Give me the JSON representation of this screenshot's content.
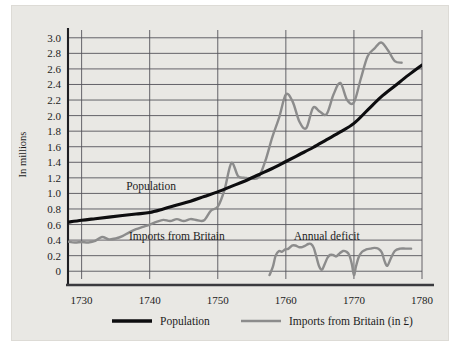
{
  "chart_data": {
    "type": "line",
    "title": "",
    "subtitle": "",
    "xlabel": "",
    "ylabel": "In millions",
    "xlim": [
      1728,
      1780
    ],
    "ylim": [
      -0.1,
      3.1
    ],
    "grid": true,
    "legend_position": "bottom",
    "x_ticks": [
      "1730",
      "1740",
      "1750",
      "1760",
      "1770",
      "1780"
    ],
    "x_tick_values": [
      1730,
      1740,
      1750,
      1760,
      1770,
      1780
    ],
    "y_ticks": [
      "0",
      "0.2",
      "0.4",
      "0.6",
      "0.8",
      "1.0",
      "1.2",
      "1.4",
      "1.6",
      "1.8",
      "2.0",
      "2.2",
      "2.4",
      "2.6",
      "2.8",
      "3.0"
    ],
    "y_tick_values": [
      0,
      0.2,
      0.4,
      0.6,
      0.8,
      1.0,
      1.2,
      1.4,
      1.6,
      1.8,
      2.0,
      2.2,
      2.4,
      2.6,
      2.8,
      3.0
    ],
    "annotations": [
      {
        "text": "Population",
        "x": 1740.2,
        "y": 1.04
      },
      {
        "text": "Imports from Britain",
        "x": 1744.0,
        "y": 0.4
      },
      {
        "text": "Annual deficit",
        "x": 1766.0,
        "y": 0.4
      }
    ],
    "series": [
      {
        "name": "Population",
        "color": "#0d0d0f",
        "x": [
          1728,
          1730,
          1732,
          1734,
          1736,
          1738,
          1740,
          1742,
          1744,
          1746,
          1748,
          1750,
          1752,
          1754,
          1756,
          1758,
          1760,
          1762,
          1764,
          1766,
          1768,
          1770,
          1772,
          1774,
          1776,
          1778,
          1780
        ],
        "y": [
          0.63,
          0.655,
          0.675,
          0.695,
          0.715,
          0.735,
          0.755,
          0.8,
          0.85,
          0.9,
          0.96,
          1.02,
          1.09,
          1.16,
          1.24,
          1.32,
          1.41,
          1.5,
          1.59,
          1.69,
          1.79,
          1.9,
          2.07,
          2.24,
          2.38,
          2.52,
          2.65
        ]
      },
      {
        "name": "Imports from Britain (in £)",
        "color": "#8c8c8c",
        "x": [
          1728,
          1729,
          1730,
          1731,
          1732,
          1733,
          1734,
          1735,
          1736,
          1737,
          1738,
          1739,
          1740,
          1741,
          1742,
          1743,
          1744,
          1745,
          1746,
          1747,
          1748,
          1749,
          1750,
          1751,
          1752,
          1753,
          1754,
          1755,
          1756,
          1757,
          1758,
          1759,
          1760,
          1761,
          1762,
          1763,
          1764,
          1765,
          1766,
          1767,
          1768,
          1769,
          1770,
          1771,
          1772,
          1773,
          1774,
          1775,
          1776,
          1777
        ],
        "y": [
          0.38,
          0.37,
          0.375,
          0.37,
          0.39,
          0.44,
          0.41,
          0.42,
          0.45,
          0.5,
          0.54,
          0.57,
          0.6,
          0.635,
          0.66,
          0.645,
          0.67,
          0.645,
          0.67,
          0.655,
          0.655,
          0.78,
          0.83,
          1.05,
          1.39,
          1.22,
          1.2,
          1.19,
          1.21,
          1.42,
          1.72,
          1.97,
          2.27,
          2.18,
          1.92,
          1.84,
          2.1,
          2.05,
          2.02,
          2.27,
          2.42,
          2.2,
          2.17,
          2.47,
          2.76,
          2.86,
          2.94,
          2.84,
          2.7,
          2.68
        ]
      },
      {
        "name": "Annual deficit",
        "color": "#8c8c8c",
        "x": [
          1757.6,
          1758,
          1758.6,
          1759,
          1759.5,
          1760,
          1760.6,
          1761,
          1761.5,
          1762,
          1762.6,
          1763,
          1763.5,
          1764,
          1764.5,
          1765,
          1765.4,
          1765.8,
          1766.2,
          1766.6,
          1767,
          1767.5,
          1768,
          1768.5,
          1769,
          1769.4,
          1769.8,
          1770,
          1770.3,
          1770.8,
          1771.3,
          1772,
          1772.6,
          1773,
          1773.5,
          1774,
          1774.4,
          1774.8,
          1775.3,
          1776,
          1776.6,
          1777.3,
          1778
        ]
      }
    ],
    "legend": [
      {
        "label": "Population",
        "color": "#0d0d0f",
        "style": "thick-black-line"
      },
      {
        "label": "Imports from Britain (in £)",
        "color": "#8c8c8c",
        "style": "thick-gray-line"
      }
    ],
    "deficit_points": {
      "x": [
        1757.6,
        1758.1,
        1758.5,
        1759.0,
        1759.4,
        1759.9,
        1760.4,
        1760.9,
        1761.4,
        1761.9,
        1762.4,
        1762.9,
        1763.3,
        1763.7,
        1764.1,
        1764.5,
        1764.9,
        1765.3,
        1765.7,
        1766.1,
        1766.5,
        1766.9,
        1767.4,
        1767.9,
        1768.4,
        1768.9,
        1769.3,
        1769.7,
        1770.0,
        1770.3,
        1770.7,
        1771.2,
        1771.8,
        1772.4,
        1773.0,
        1773.6,
        1774.1,
        1774.5,
        1774.9,
        1775.4,
        1776.0,
        1776.8,
        1777.6,
        1778.4
      ],
      "y": [
        -0.05,
        0.06,
        0.2,
        0.26,
        0.25,
        0.28,
        0.29,
        0.33,
        0.33,
        0.31,
        0.31,
        0.33,
        0.35,
        0.35,
        0.3,
        0.18,
        0.06,
        0.02,
        0.09,
        0.17,
        0.21,
        0.21,
        0.19,
        0.23,
        0.26,
        0.25,
        0.21,
        0.09,
        -0.05,
        0.06,
        0.18,
        0.25,
        0.28,
        0.29,
        0.3,
        0.29,
        0.24,
        0.13,
        0.07,
        0.16,
        0.26,
        0.29,
        0.29,
        0.29
      ]
    }
  }
}
